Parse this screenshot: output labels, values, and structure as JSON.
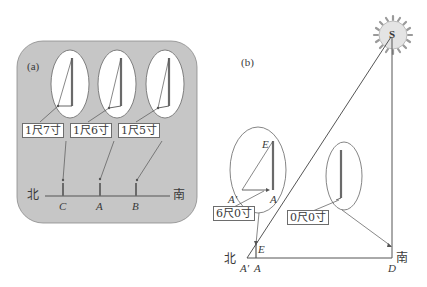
{
  "panel_a": {
    "tag": "(a)",
    "background": "#c6c6c6",
    "north_label": "北",
    "south_label": "南",
    "points": [
      "C",
      "A",
      "B"
    ],
    "shadow_labels": [
      "1尺7寸",
      "1尺6寸",
      "1尺5寸"
    ]
  },
  "panel_b": {
    "tag": "(b)",
    "sun_label": "S",
    "north_label": "北",
    "south_label": "南",
    "points": {
      "a_prime": "A′",
      "a": "A",
      "e": "E",
      "d": "D",
      "inset_e": "E",
      "inset_a_prime": "A′",
      "inset_a": "A"
    },
    "shadow_labels": [
      "6尺0寸",
      "0尺0寸"
    ]
  },
  "colors": {
    "line": "#555555",
    "gnomon": "#6a6a6a",
    "panel_fill": "#c6c6c6",
    "ellipse_fill": "#ffffff",
    "sun_fill": "#e4e4e4",
    "sun_rays": "#9a9a9a"
  }
}
